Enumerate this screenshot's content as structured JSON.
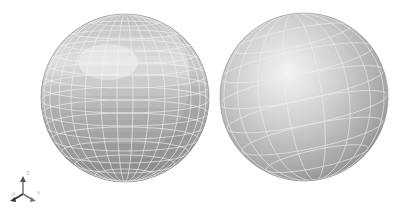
{
  "scene": {
    "background": "#ffffff",
    "spheres": [
      {
        "name": "faceted-sphere",
        "shading": "flat",
        "cx": 125,
        "cy": 98,
        "r": 84,
        "grid_color": "#f2f2f2"
      },
      {
        "name": "smooth-sphere",
        "shading": "smooth",
        "cx": 304,
        "cy": 97,
        "r": 84,
        "grid_color": "#ececec"
      }
    ]
  },
  "axis_triad": {
    "x_label": "X",
    "y_label": "Y",
    "z_label": "Z"
  }
}
